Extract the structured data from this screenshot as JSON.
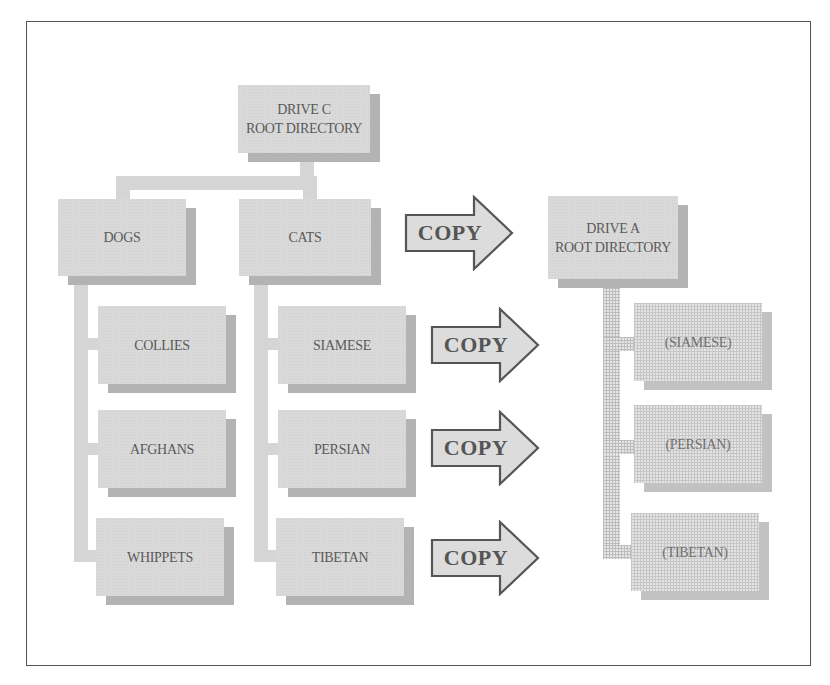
{
  "diagram": {
    "type": "directory-tree-copy",
    "source": {
      "root": {
        "line1": "DRIVE C",
        "line2": "ROOT DIRECTORY"
      },
      "folders": [
        {
          "label": "DOGS",
          "children": [
            "COLLIES",
            "AFGHANS",
            "WHIPPETS"
          ]
        },
        {
          "label": "CATS",
          "children": [
            "SIAMESE",
            "PERSIAN",
            "TIBETAN"
          ]
        }
      ]
    },
    "arrows": [
      {
        "label": "COPY"
      },
      {
        "label": "COPY"
      },
      {
        "label": "COPY"
      },
      {
        "label": "COPY"
      }
    ],
    "destination": {
      "root": {
        "line1": "DRIVE A",
        "line2": "ROOT DIRECTORY"
      },
      "children": [
        "(SIAMESE)",
        "(PERSIAN)",
        "(TIBETAN)"
      ]
    }
  },
  "colors": {
    "box_fill": "#d9d9d9",
    "box_shadow": "#b3b3b3",
    "text": "#5a5a5a",
    "frame": "#555555",
    "arrow_stroke": "#555555"
  }
}
